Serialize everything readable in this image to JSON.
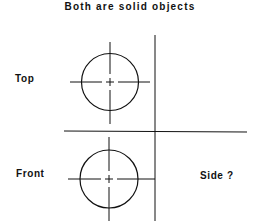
{
  "title": "Both are solid objects",
  "views": {
    "top": {
      "label": "Top",
      "shape": "circle-with-centerlines"
    },
    "front": {
      "label": "Front",
      "shape": "circle-with-centerlines"
    },
    "side": {
      "label": "Side ?"
    }
  },
  "colors": {
    "line": "#111111",
    "background": "#ffffff"
  }
}
